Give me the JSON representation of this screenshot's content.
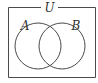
{
  "diagram": {
    "type": "venn",
    "universe_label": "U",
    "sets": [
      {
        "label": "A"
      },
      {
        "label": "B"
      }
    ],
    "colors": {
      "stroke": "#4a4a4a",
      "background": "#ffffff"
    }
  }
}
